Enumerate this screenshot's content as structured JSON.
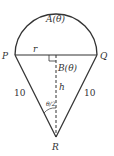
{
  "diagram": {
    "points": {
      "P": "P",
      "Q": "Q",
      "R": "R"
    },
    "labels": {
      "arc_area": "A(θ)",
      "triangle_area": "B(θ)",
      "radius": "r",
      "height": "h",
      "side_left": "10",
      "side_right": "10",
      "half_angle": "θ/2"
    },
    "colors": {
      "stroke": "#333333",
      "background": "#ffffff"
    }
  }
}
